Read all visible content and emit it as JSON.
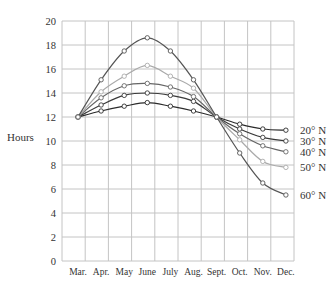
{
  "chart_data": {
    "type": "line",
    "title": "",
    "xlabel": "",
    "ylabel": "Hours",
    "ylim": [
      0,
      20
    ],
    "yticks": [
      0,
      2,
      4,
      6,
      8,
      10,
      12,
      14,
      16,
      18,
      20
    ],
    "grid": true,
    "legend_position": "inline-right",
    "categories": [
      "Mar.",
      "Apr.",
      "May",
      "June",
      "July",
      "Aug.",
      "Sept.",
      "Oct.",
      "Nov.",
      "Dec."
    ],
    "series": [
      {
        "name": "20° N",
        "color": "#2b2b2b",
        "values": [
          12.0,
          12.5,
          12.9,
          13.2,
          12.9,
          12.5,
          12.0,
          11.4,
          11.0,
          10.9
        ]
      },
      {
        "name": "30° N",
        "color": "#3a3a3a",
        "values": [
          12.0,
          13.0,
          13.8,
          14.0,
          13.8,
          13.3,
          12.0,
          11.0,
          10.3,
          10.0
        ]
      },
      {
        "name": "40° N",
        "color": "#666666",
        "values": [
          12.0,
          13.6,
          14.6,
          14.8,
          14.5,
          13.7,
          12.0,
          10.6,
          9.6,
          9.1
        ]
      },
      {
        "name": "50° N",
        "color": "#aaaaaa",
        "values": [
          12.0,
          14.1,
          15.4,
          16.3,
          15.4,
          14.4,
          12.0,
          10.1,
          8.3,
          7.8
        ]
      },
      {
        "name": "60° N",
        "color": "#555555",
        "values": [
          12.0,
          15.1,
          17.5,
          18.6,
          17.5,
          15.1,
          12.0,
          9.0,
          6.5,
          5.5
        ]
      }
    ]
  }
}
